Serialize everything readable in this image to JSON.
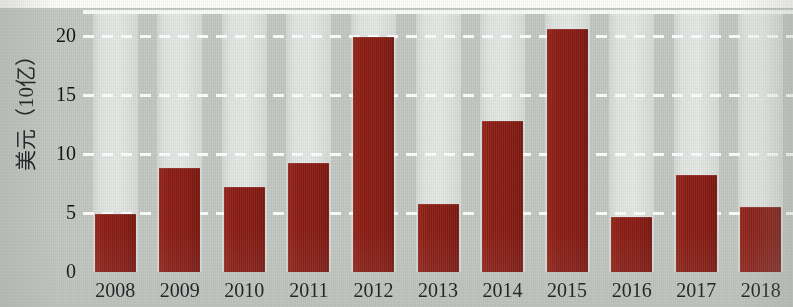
{
  "chart_data": {
    "type": "bar",
    "title": "",
    "subtitle": "",
    "xlabel": "",
    "ylabel": "美元（10亿）",
    "categories": [
      "2008",
      "2009",
      "2010",
      "2011",
      "2012",
      "2013",
      "2014",
      "2015",
      "2016",
      "2017",
      "2018"
    ],
    "values": [
      4.9,
      8.8,
      7.2,
      9.2,
      19.9,
      5.8,
      12.8,
      20.6,
      4.7,
      8.2,
      5.5
    ],
    "series": [
      {
        "name": "",
        "values": [
          4.9,
          8.8,
          7.2,
          9.2,
          19.9,
          5.8,
          12.8,
          20.6,
          4.7,
          8.2,
          5.5
        ]
      }
    ],
    "ylim": [
      0,
      22.2
    ],
    "yticks": [
      0,
      5,
      10,
      15,
      20
    ],
    "ytick_labels": [
      "0",
      "5",
      "10",
      "15",
      "20"
    ],
    "grid": true,
    "grid_style": "dashed-white-horizontal",
    "legend": false,
    "legend_position": "none",
    "bar_color": "#8d1d15",
    "band_color": "#e3e7e3",
    "background_color": "#c5cac5",
    "gridline_color": "#ffffff",
    "axis_line_color": "#fbfbf9",
    "tick_label_color": "#141518"
  }
}
